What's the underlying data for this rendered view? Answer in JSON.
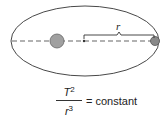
{
  "diagram": {
    "radius_label": "r",
    "colors": {
      "orbit": "#333333",
      "axis": "#999999",
      "star": "#999999",
      "planet": "#888888",
      "bracket": "#333333"
    }
  },
  "formula": {
    "numerator_base": "T",
    "numerator_exp": "2",
    "denominator_base": "r",
    "denominator_exp": "3",
    "rhs": "= constant"
  }
}
